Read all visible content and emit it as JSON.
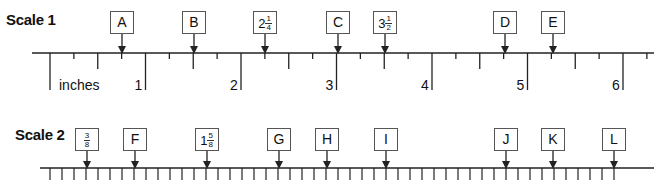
{
  "scale1": {
    "title": "Scale 1",
    "unit_label": "inches",
    "origin_x": 50,
    "px_per_inch": 95.5,
    "baseline_y": 53,
    "inch_labels": [
      "1",
      "2",
      "3",
      "4",
      "5",
      "6"
    ],
    "markers": [
      {
        "id": "A",
        "label": "A",
        "x": 122
      },
      {
        "id": "B",
        "label": "B",
        "x": 194
      },
      {
        "id": "2-1/4",
        "whole": "2",
        "num": "1",
        "den": "4",
        "x": 265
      },
      {
        "id": "C",
        "label": "C",
        "x": 338
      },
      {
        "id": "3-1/2",
        "whole": "3",
        "num": "1",
        "den": "2",
        "x": 385
      },
      {
        "id": "D",
        "label": "D",
        "x": 505
      },
      {
        "id": "E",
        "label": "E",
        "x": 553
      }
    ]
  },
  "scale2": {
    "title": "Scale 2",
    "baseline_y": 168,
    "tick_start_x": 50,
    "tick_spacing": 12,
    "tick_count": 48,
    "markers": [
      {
        "id": "3/8",
        "num": "3",
        "den": "8",
        "x": 87
      },
      {
        "id": "F",
        "label": "F",
        "x": 135
      },
      {
        "id": "1-5/8",
        "whole": "1",
        "num": "5",
        "den": "8",
        "x": 207
      },
      {
        "id": "G",
        "label": "G",
        "x": 279
      },
      {
        "id": "H",
        "label": "H",
        "x": 327
      },
      {
        "id": "I",
        "label": "I",
        "x": 386
      },
      {
        "id": "J",
        "label": "J",
        "x": 506
      },
      {
        "id": "K",
        "label": "K",
        "x": 553
      },
      {
        "id": "L",
        "label": "L",
        "x": 614
      }
    ]
  },
  "colors": {
    "line": "#222222",
    "box_border": "#555555",
    "text": "#111111"
  }
}
